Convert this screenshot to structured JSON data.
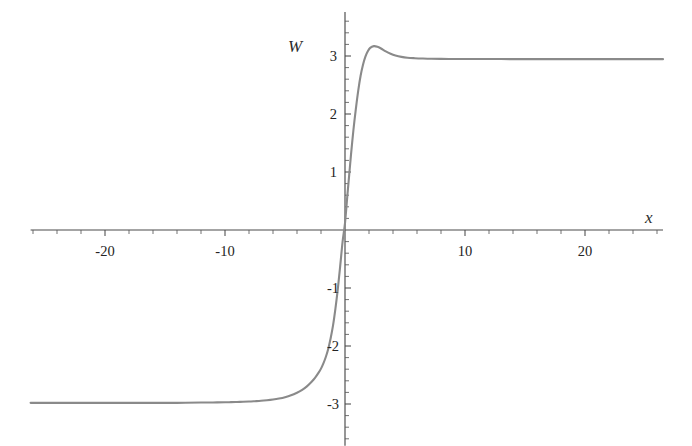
{
  "chart_data": {
    "type": "line",
    "title": "",
    "subtitle": "",
    "xlabel": "x",
    "ylabel": "W",
    "xlim": [
      -26.2,
      26.5
    ],
    "ylim": [
      -3.72,
      3.76
    ],
    "grid": false,
    "legend": null,
    "axis_style": "crossed-axes-at-origin",
    "xticks": [
      -20,
      -10,
      10,
      20
    ],
    "xtick_labels": [
      "-20",
      "-10",
      "10",
      "20"
    ],
    "yticks": [
      3,
      2,
      1,
      -1,
      -2,
      -3
    ],
    "ytick_labels": [
      "3",
      "2",
      "1",
      "-1",
      "-2",
      "-3"
    ],
    "x_minor_tick_step": 2,
    "y_minor_tick_step": 0.2,
    "series": [
      {
        "name": "W(x)",
        "color": "#8a8a8a",
        "line_width": 2.1,
        "description": "kink / domain-wall profile: saturates near -2.98 for x<<0, rises steeply through zero near x=0.3, overshoots to about 3.17 near x=2.4, then relaxes to about 2.95 plateau",
        "left_asymptote": -2.98,
        "right_plateau": 2.95,
        "overshoot_peak": {
          "x": 2.4,
          "y": 3.17
        },
        "zero_crossing_x": 0.35,
        "x": [
          -26.2,
          -24,
          -22,
          -20,
          -18,
          -16,
          -14,
          -12,
          -11,
          -10,
          -9.5,
          -9,
          -8.5,
          -8,
          -7.5,
          -7,
          -6.5,
          -6,
          -5.5,
          -5,
          -4.5,
          -4,
          -3.6,
          -3.2,
          -2.8,
          -2.5,
          -2.2,
          -2,
          -1.8,
          -1.6,
          -1.4,
          -1.2,
          -1,
          -0.8,
          -0.6,
          -0.4,
          -0.2,
          0,
          0.2,
          0.35,
          0.5,
          0.7,
          0.9,
          1.1,
          1.3,
          1.5,
          1.7,
          1.9,
          2.1,
          2.4,
          2.7,
          3,
          3.4,
          3.8,
          4.2,
          4.7,
          5.2,
          5.8,
          6.5,
          7.2,
          8,
          9,
          10,
          11.5,
          13,
          15,
          17,
          19,
          21,
          23,
          25,
          26.5
        ],
        "y": [
          -2.98,
          -2.98,
          -2.98,
          -2.98,
          -2.98,
          -2.98,
          -2.98,
          -2.975,
          -2.973,
          -2.97,
          -2.968,
          -2.965,
          -2.962,
          -2.958,
          -2.952,
          -2.945,
          -2.935,
          -2.922,
          -2.905,
          -2.882,
          -2.85,
          -2.805,
          -2.76,
          -2.7,
          -2.62,
          -2.55,
          -2.46,
          -2.39,
          -2.3,
          -2.19,
          -2.05,
          -1.87,
          -1.65,
          -1.36,
          -1.02,
          -0.62,
          -0.2,
          0.12,
          0.6,
          0.95,
          1.3,
          1.72,
          2.08,
          2.4,
          2.66,
          2.85,
          2.99,
          3.08,
          3.14,
          3.17,
          3.16,
          3.13,
          3.08,
          3.04,
          3.01,
          2.985,
          2.97,
          2.962,
          2.956,
          2.952,
          2.95,
          2.949,
          2.948,
          2.947,
          2.947,
          2.946,
          2.946,
          2.946,
          2.946,
          2.946,
          2.946,
          2.946
        ]
      }
    ],
    "colors": {
      "curve": "#8a8a8a",
      "axis": "#4a4a4a",
      "text": "#242424",
      "background": "#ffffff"
    }
  },
  "labels": {
    "y_axis_variable": "W",
    "x_axis_variable": "x"
  }
}
